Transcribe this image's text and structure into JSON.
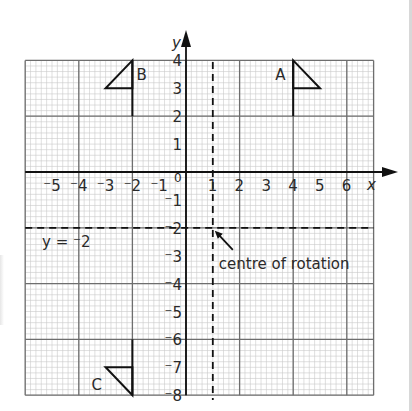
{
  "diagram": {
    "x_axis": {
      "label": "x",
      "min": -6,
      "max": 7,
      "tick_labels": [
        "⁻5",
        "⁻4",
        "⁻3",
        "⁻2",
        "⁻1",
        "0",
        "1",
        "2",
        "3",
        "4",
        "5",
        "6"
      ],
      "tick_values": [
        -5,
        -4,
        -3,
        -2,
        -1,
        0,
        1,
        2,
        3,
        4,
        5,
        6
      ]
    },
    "y_axis": {
      "label": "y",
      "min": -8,
      "max": 4,
      "tick_labels": [
        "4",
        "3",
        "2",
        "1",
        "⁻1",
        "⁻2",
        "⁻3",
        "⁻4",
        "⁻5",
        "⁻6",
        "⁻7",
        "⁻8"
      ],
      "tick_values": [
        4,
        3,
        2,
        1,
        -1,
        -2,
        -3,
        -4,
        -5,
        -6,
        -7,
        -8
      ]
    },
    "grid": {
      "major_every": 2,
      "minor_per_unit": 5
    },
    "shapes": [
      {
        "name": "A",
        "label": "A",
        "points": [
          [
            4,
            2
          ],
          [
            4,
            4
          ],
          [
            5,
            3
          ],
          [
            4,
            3
          ]
        ]
      },
      {
        "name": "B",
        "label": "B",
        "points": [
          [
            -2,
            2
          ],
          [
            -2,
            4
          ],
          [
            -3,
            3
          ],
          [
            -2,
            3
          ]
        ]
      },
      {
        "name": "C",
        "label": "C",
        "points": [
          [
            -2,
            -6
          ],
          [
            -2,
            -8
          ],
          [
            -3,
            -7
          ],
          [
            -2,
            -7
          ]
        ]
      }
    ],
    "dashed_lines": [
      {
        "name": "line-x-1",
        "orientation": "vertical",
        "value": 1
      },
      {
        "name": "line-y-minus-2",
        "orientation": "horizontal",
        "value": -2,
        "label": "y = ⁻2"
      }
    ],
    "annotation": {
      "text": "centre of rotation",
      "point": [
        1,
        -2
      ]
    },
    "colors": {
      "ink": "#111111",
      "grid_minor": "#c9c9c9",
      "grid_major": "#6e6e6e",
      "text": "#2a2a2a"
    }
  }
}
